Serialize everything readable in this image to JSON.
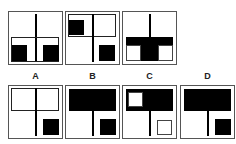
{
  "puzzle": {
    "sequence": [
      {
        "id": "panel-1",
        "description": "vertical line top-center, horizontal rectangle outline lower half, two black squares bottom-left and bottom-right"
      },
      {
        "id": "panel-2",
        "description": "horizontal outline top half, vertical line full height, black square top-left, black square bottom-right"
      },
      {
        "id": "panel-3",
        "description": "vertical line top-center, black horizontal bar lower-mid with black center block, white squares bottom-left and bottom-right"
      }
    ],
    "options": [
      {
        "label": "A",
        "description": "outline rectangle top half, vertical line center, black square bottom-right"
      },
      {
        "label": "B",
        "description": "black bar top half, vertical line bottom center, black square bottom-right"
      },
      {
        "label": "C",
        "description": "black bar top half with white square top-left, vertical line bottom center, white square bottom-right"
      },
      {
        "label": "D",
        "description": "black bar top half, vertical line bottom center, black square bottom-right"
      }
    ]
  }
}
